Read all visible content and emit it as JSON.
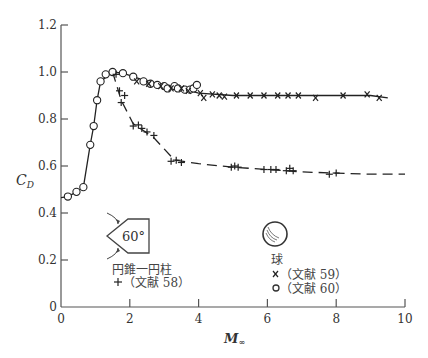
{
  "chart_data": {
    "type": "scatter",
    "title": "",
    "xlabel": "M∞",
    "ylabel": "C_D",
    "xlim": [
      0,
      10
    ],
    "ylim": [
      0,
      1.2
    ],
    "xticks": [
      0,
      2,
      4,
      6,
      8,
      10
    ],
    "yticks": [
      0,
      0.2,
      0.4,
      0.6,
      0.8,
      1.0,
      1.2
    ],
    "ytick_labels": [
      "0",
      "0.2",
      "0.4",
      "0.6",
      "0.8",
      "1.0",
      "1.2"
    ],
    "xtick_labels": [
      "0",
      "2",
      "4",
      "6",
      "8",
      "10"
    ],
    "grid": false,
    "series": [
      {
        "name": "球 (文献 60)",
        "marker": "o",
        "body": "sphere",
        "x": [
          0.2,
          0.45,
          0.65,
          0.85,
          0.95,
          1.05,
          1.15,
          1.3,
          1.5,
          1.8,
          2.1,
          2.4,
          2.6,
          2.8,
          3.0,
          3.1,
          3.3,
          3.4,
          3.6,
          3.75,
          3.85,
          3.95
        ],
        "y": [
          0.47,
          0.49,
          0.51,
          0.69,
          0.77,
          0.88,
          0.96,
          0.99,
          1.0,
          0.995,
          0.98,
          0.96,
          0.95,
          0.945,
          0.94,
          0.93,
          0.94,
          0.93,
          0.925,
          0.925,
          0.93,
          0.945
        ]
      },
      {
        "name": "球 (文献 59)",
        "marker": "x",
        "body": "sphere",
        "x": [
          2.2,
          2.55,
          2.9,
          3.2,
          3.5,
          3.7,
          4.05,
          4.15,
          4.4,
          4.6,
          4.75,
          5.1,
          5.5,
          5.9,
          6.3,
          6.6,
          6.9,
          7.4,
          8.2,
          8.9,
          9.25
        ],
        "y": [
          0.96,
          0.95,
          0.94,
          0.93,
          0.93,
          0.92,
          0.91,
          0.89,
          0.905,
          0.9,
          0.895,
          0.9,
          0.9,
          0.9,
          0.9,
          0.9,
          0.9,
          0.89,
          0.9,
          0.905,
          0.89
        ]
      },
      {
        "name": "円錐一円柱 (文献 58)",
        "marker": "+",
        "body": "cone-cylinder 60°",
        "x": [
          1.6,
          1.7,
          1.85,
          1.75,
          2.1,
          2.25,
          2.35,
          2.5,
          2.7,
          3.2,
          3.35,
          3.5,
          4.95,
          5.05,
          5.15,
          5.9,
          6.1,
          6.25,
          6.55,
          6.65,
          6.75,
          7.8,
          8.0
        ],
        "y": [
          0.99,
          0.92,
          0.9,
          0.87,
          0.77,
          0.775,
          0.76,
          0.745,
          0.73,
          0.62,
          0.625,
          0.615,
          0.595,
          0.6,
          0.595,
          0.585,
          0.585,
          0.585,
          0.58,
          0.59,
          0.58,
          0.565,
          0.57
        ]
      }
    ],
    "curves": [
      {
        "name": "sphere-fit",
        "x": [
          0.0,
          0.2,
          0.45,
          0.65,
          0.85,
          0.95,
          1.05,
          1.15,
          1.5,
          1.8,
          2.4,
          3.0,
          3.5,
          4.0,
          5.0,
          6.0,
          7.0,
          8.0,
          9.0,
          9.5
        ],
        "y": [
          0.465,
          0.47,
          0.49,
          0.51,
          0.69,
          0.77,
          0.88,
          0.96,
          1.0,
          0.995,
          0.965,
          0.945,
          0.93,
          0.91,
          0.9,
          0.9,
          0.9,
          0.9,
          0.9,
          0.89
        ]
      },
      {
        "name": "cone-cylinder-fit",
        "x": [
          1.5,
          1.75,
          2.1,
          2.7,
          3.3,
          4.0,
          5.0,
          6.0,
          7.0,
          8.0,
          9.0,
          10.0
        ],
        "y": [
          1.0,
          0.88,
          0.78,
          0.72,
          0.625,
          0.61,
          0.595,
          0.585,
          0.575,
          0.57,
          0.565,
          0.565
        ]
      }
    ],
    "legend": {
      "position": "inside-lower",
      "groups": [
        {
          "title": "円錐一円柱",
          "shape_label": "60°",
          "entries": [
            {
              "marker": "+",
              "label": "（文献 58）"
            }
          ]
        },
        {
          "title": "球",
          "entries": [
            {
              "marker": "x",
              "label": "（文献 59）"
            },
            {
              "marker": "o",
              "label": "（文献 60）"
            }
          ]
        }
      ]
    }
  },
  "labels": {
    "ylabel_main": "C",
    "ylabel_sub": "D",
    "xlabel_main": "M",
    "xlabel_sub": "∞",
    "cone_title": "円錐一円柱",
    "cone_angle": "60°",
    "cone_ref": "（文献 58）",
    "sphere_title": "球",
    "sphere_ref_x": "（文献 59）",
    "sphere_ref_o": "（文献 60）"
  }
}
